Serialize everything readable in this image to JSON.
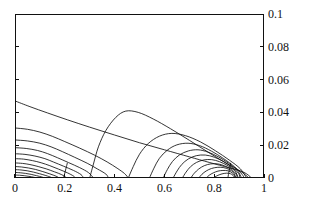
{
  "chart_data": {
    "type": "line",
    "subtype": "contour",
    "title": "",
    "xlabel": "",
    "ylabel": "",
    "xlim": [
      0,
      1
    ],
    "ylim": [
      0,
      0.1
    ],
    "grid": false,
    "legend": "none",
    "x_ticks": [
      "0",
      "0.2",
      "0.4",
      "0.6",
      "0.8",
      "1"
    ],
    "x_tick_values": [
      0,
      0.2,
      0.4,
      0.6,
      0.8,
      1
    ],
    "y_ticks": [
      "0",
      "0.02",
      "0.04",
      "0.06",
      "0.08",
      "0.1"
    ],
    "y_tick_values": [
      0,
      0.02,
      0.04,
      0.06,
      0.08,
      0.1
    ],
    "y_axis_side": "right",
    "line_color": "#111111",
    "background": "#ffffff",
    "contours": [
      {
        "name": "outer-envelope",
        "points": [
          [
            0.0,
            0.047
          ],
          [
            0.06,
            0.0435
          ],
          [
            0.13,
            0.0397
          ],
          [
            0.21,
            0.0355
          ],
          [
            0.3,
            0.031
          ],
          [
            0.4,
            0.0262
          ],
          [
            0.5,
            0.0215
          ],
          [
            0.6,
            0.0172
          ],
          [
            0.7,
            0.0129
          ],
          [
            0.78,
            0.0095
          ],
          [
            0.86,
            0.0062
          ],
          [
            0.92,
            0.0034
          ],
          [
            0.95,
            0.0
          ]
        ]
      },
      {
        "name": "left-lobe-1",
        "points": [
          [
            0.0,
            0.0305
          ],
          [
            0.05,
            0.0297
          ],
          [
            0.1,
            0.028
          ],
          [
            0.15,
            0.0254
          ],
          [
            0.2,
            0.0222
          ],
          [
            0.26,
            0.0182
          ],
          [
            0.32,
            0.0139
          ],
          [
            0.37,
            0.0098
          ],
          [
            0.41,
            0.006
          ],
          [
            0.44,
            0.0027
          ],
          [
            0.455,
            0.0
          ]
        ]
      },
      {
        "name": "left-lobe-2",
        "points": [
          [
            0.0,
            0.0232
          ],
          [
            0.05,
            0.0226
          ],
          [
            0.1,
            0.0212
          ],
          [
            0.145,
            0.019
          ],
          [
            0.19,
            0.0161
          ],
          [
            0.24,
            0.0126
          ],
          [
            0.29,
            0.009
          ],
          [
            0.33,
            0.0056
          ],
          [
            0.365,
            0.0024
          ],
          [
            0.375,
            0.0
          ]
        ]
      },
      {
        "name": "left-lobe-3",
        "points": [
          [
            0.0,
            0.0185
          ],
          [
            0.045,
            0.018
          ],
          [
            0.09,
            0.0168
          ],
          [
            0.13,
            0.0149
          ],
          [
            0.17,
            0.0124
          ],
          [
            0.215,
            0.0094
          ],
          [
            0.26,
            0.0063
          ],
          [
            0.295,
            0.0033
          ],
          [
            0.315,
            0.0
          ]
        ]
      },
      {
        "name": "left-lobe-4",
        "points": [
          [
            0.0,
            0.0148
          ],
          [
            0.04,
            0.0144
          ],
          [
            0.08,
            0.0134
          ],
          [
            0.12,
            0.0118
          ],
          [
            0.155,
            0.0097
          ],
          [
            0.195,
            0.0072
          ],
          [
            0.235,
            0.0046
          ],
          [
            0.265,
            0.0021
          ],
          [
            0.275,
            0.0
          ]
        ]
      },
      {
        "name": "left-lobe-5",
        "points": [
          [
            0.0,
            0.0118
          ],
          [
            0.035,
            0.0115
          ],
          [
            0.07,
            0.0106
          ],
          [
            0.105,
            0.0093
          ],
          [
            0.14,
            0.0075
          ],
          [
            0.175,
            0.0054
          ],
          [
            0.21,
            0.0032
          ],
          [
            0.235,
            0.0012
          ],
          [
            0.243,
            0.0
          ]
        ]
      },
      {
        "name": "left-lobe-6",
        "points": [
          [
            0.0,
            0.0092
          ],
          [
            0.03,
            0.0089
          ],
          [
            0.06,
            0.0082
          ],
          [
            0.093,
            0.007
          ],
          [
            0.125,
            0.0056
          ],
          [
            0.158,
            0.0038
          ],
          [
            0.188,
            0.002
          ],
          [
            0.208,
            0.0
          ]
        ]
      },
      {
        "name": "left-lobe-7",
        "points": [
          [
            0.0,
            0.007
          ],
          [
            0.027,
            0.0067
          ],
          [
            0.055,
            0.0061
          ],
          [
            0.083,
            0.0052
          ],
          [
            0.112,
            0.0039
          ],
          [
            0.14,
            0.0025
          ],
          [
            0.165,
            0.0011
          ],
          [
            0.178,
            0.0
          ]
        ]
      },
      {
        "name": "left-lobe-8",
        "points": [
          [
            0.0,
            0.0051
          ],
          [
            0.024,
            0.0049
          ],
          [
            0.049,
            0.0044
          ],
          [
            0.074,
            0.0036
          ],
          [
            0.099,
            0.0026
          ],
          [
            0.124,
            0.0015
          ],
          [
            0.145,
            0.0004
          ],
          [
            0.15,
            0.0
          ]
        ]
      },
      {
        "name": "left-lobe-9",
        "points": [
          [
            0.0,
            0.0034
          ],
          [
            0.021,
            0.0032
          ],
          [
            0.043,
            0.0028
          ],
          [
            0.065,
            0.0022
          ],
          [
            0.087,
            0.0014
          ],
          [
            0.108,
            0.0006
          ],
          [
            0.12,
            0.0
          ]
        ]
      },
      {
        "name": "left-lobe-10",
        "points": [
          [
            0.0,
            0.0018
          ],
          [
            0.018,
            0.0017
          ],
          [
            0.037,
            0.0014
          ],
          [
            0.056,
            0.001
          ],
          [
            0.074,
            0.0005
          ],
          [
            0.088,
            0.0
          ]
        ]
      },
      {
        "name": "left-peak-ridge",
        "points": [
          [
            0.195,
            0.0
          ],
          [
            0.2,
            0.003
          ],
          [
            0.205,
            0.006
          ],
          [
            0.21,
            0.009
          ]
        ]
      },
      {
        "name": "right-lobe-outer",
        "points": [
          [
            0.3,
            0.0
          ],
          [
            0.315,
            0.0085
          ],
          [
            0.335,
            0.019
          ],
          [
            0.365,
            0.029
          ],
          [
            0.405,
            0.037
          ],
          [
            0.445,
            0.0408
          ],
          [
            0.495,
            0.04
          ],
          [
            0.555,
            0.036
          ],
          [
            0.625,
            0.03
          ],
          [
            0.7,
            0.023
          ],
          [
            0.775,
            0.0158
          ],
          [
            0.845,
            0.0093
          ],
          [
            0.905,
            0.0042
          ],
          [
            0.94,
            0.0
          ]
        ]
      },
      {
        "name": "right-lobe-1",
        "points": [
          [
            0.455,
            0.0
          ],
          [
            0.475,
            0.007
          ],
          [
            0.5,
            0.0145
          ],
          [
            0.535,
            0.021
          ],
          [
            0.58,
            0.0255
          ],
          [
            0.63,
            0.0272
          ],
          [
            0.685,
            0.0258
          ],
          [
            0.745,
            0.022
          ],
          [
            0.805,
            0.0166
          ],
          [
            0.86,
            0.011
          ],
          [
            0.905,
            0.0056
          ],
          [
            0.93,
            0.0
          ]
        ]
      },
      {
        "name": "right-lobe-2",
        "points": [
          [
            0.54,
            0.0
          ],
          [
            0.558,
            0.006
          ],
          [
            0.58,
            0.012
          ],
          [
            0.612,
            0.017
          ],
          [
            0.65,
            0.0202
          ],
          [
            0.695,
            0.0212
          ],
          [
            0.742,
            0.0197
          ],
          [
            0.79,
            0.0163
          ],
          [
            0.838,
            0.0118
          ],
          [
            0.882,
            0.0068
          ],
          [
            0.912,
            0.0022
          ],
          [
            0.92,
            0.0
          ]
        ]
      },
      {
        "name": "right-lobe-3",
        "points": [
          [
            0.595,
            0.0
          ],
          [
            0.612,
            0.0052
          ],
          [
            0.632,
            0.01
          ],
          [
            0.66,
            0.014
          ],
          [
            0.696,
            0.0165
          ],
          [
            0.735,
            0.0172
          ],
          [
            0.775,
            0.0158
          ],
          [
            0.818,
            0.0128
          ],
          [
            0.858,
            0.009
          ],
          [
            0.892,
            0.0048
          ],
          [
            0.91,
            0.0
          ]
        ]
      },
      {
        "name": "right-lobe-4",
        "points": [
          [
            0.635,
            0.0
          ],
          [
            0.651,
            0.0043
          ],
          [
            0.67,
            0.0083
          ],
          [
            0.696,
            0.0116
          ],
          [
            0.728,
            0.0136
          ],
          [
            0.764,
            0.014
          ],
          [
            0.8,
            0.0127
          ],
          [
            0.838,
            0.01
          ],
          [
            0.872,
            0.0065
          ],
          [
            0.898,
            0.0028
          ],
          [
            0.903,
            0.0
          ]
        ]
      },
      {
        "name": "right-lobe-5",
        "points": [
          [
            0.672,
            0.0
          ],
          [
            0.687,
            0.0036
          ],
          [
            0.705,
            0.0069
          ],
          [
            0.729,
            0.0095
          ],
          [
            0.758,
            0.011
          ],
          [
            0.79,
            0.0112
          ],
          [
            0.822,
            0.0099
          ],
          [
            0.855,
            0.0075
          ],
          [
            0.883,
            0.0044
          ],
          [
            0.897,
            0.0
          ]
        ]
      },
      {
        "name": "right-lobe-6",
        "points": [
          [
            0.706,
            0.0
          ],
          [
            0.72,
            0.0029
          ],
          [
            0.738,
            0.0055
          ],
          [
            0.76,
            0.0075
          ],
          [
            0.786,
            0.0086
          ],
          [
            0.814,
            0.0086
          ],
          [
            0.842,
            0.0074
          ],
          [
            0.869,
            0.0052
          ],
          [
            0.888,
            0.0024
          ],
          [
            0.892,
            0.0
          ]
        ]
      },
      {
        "name": "right-lobe-7",
        "points": [
          [
            0.738,
            0.0
          ],
          [
            0.751,
            0.0023
          ],
          [
            0.768,
            0.0043
          ],
          [
            0.789,
            0.0058
          ],
          [
            0.812,
            0.0065
          ],
          [
            0.836,
            0.0064
          ],
          [
            0.859,
            0.0053
          ],
          [
            0.878,
            0.0033
          ],
          [
            0.887,
            0.0
          ]
        ]
      },
      {
        "name": "right-lobe-8",
        "points": [
          [
            0.768,
            0.0
          ],
          [
            0.78,
            0.0017
          ],
          [
            0.796,
            0.0031
          ],
          [
            0.815,
            0.0042
          ],
          [
            0.835,
            0.0046
          ],
          [
            0.855,
            0.0044
          ],
          [
            0.872,
            0.0032
          ],
          [
            0.882,
            0.0014
          ],
          [
            0.883,
            0.0
          ]
        ]
      },
      {
        "name": "right-lobe-9",
        "points": [
          [
            0.797,
            0.0
          ],
          [
            0.808,
            0.0011
          ],
          [
            0.823,
            0.0021
          ],
          [
            0.84,
            0.0028
          ],
          [
            0.857,
            0.0029
          ],
          [
            0.871,
            0.0022
          ],
          [
            0.879,
            0.0009
          ],
          [
            0.879,
            0.0
          ]
        ]
      },
      {
        "name": "right-peak-ridge",
        "points": [
          [
            0.855,
            0.0
          ],
          [
            0.858,
            0.0028
          ],
          [
            0.862,
            0.0058
          ],
          [
            0.866,
            0.009
          ]
        ]
      }
    ]
  }
}
